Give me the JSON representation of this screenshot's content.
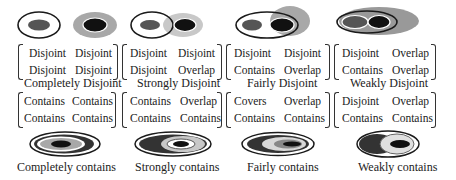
{
  "colors": {
    "outline": "#1a1a1a",
    "dark": "#111111",
    "mid_gray": "#555555",
    "light_gray": "#a8a8a8",
    "pale_gray": "#d0d0d0"
  },
  "top_row": [
    {
      "caption": "Completely Disjoint",
      "matrix": [
        [
          "Disjoint",
          "Disjoint"
        ],
        [
          "Disjoint",
          "Disjoint"
        ]
      ]
    },
    {
      "caption": "Strongly Disjoint",
      "matrix": [
        [
          "Disjoint",
          "Disjoint"
        ],
        [
          "Disjoint",
          "Overlap"
        ]
      ]
    },
    {
      "caption": "Fairly Disjoint",
      "matrix": [
        [
          "Disjoint",
          "Disjoint"
        ],
        [
          "Contains",
          "Overlap"
        ]
      ]
    },
    {
      "caption": "Weakly Disjoint",
      "matrix": [
        [
          "Disjoint",
          "Overlap"
        ],
        [
          "Contains",
          "Overlap"
        ]
      ]
    }
  ],
  "bottom_row": [
    {
      "caption": "Completely contains",
      "matrix": [
        [
          "Contains",
          "Contains"
        ],
        [
          "Contains",
          "Contains"
        ]
      ]
    },
    {
      "caption": "Strongly contains",
      "matrix": [
        [
          "Contains",
          "Overlap"
        ],
        [
          "Contains",
          "Contains"
        ]
      ]
    },
    {
      "caption": "Fairly contains",
      "matrix": [
        [
          "Covers",
          "Overlap"
        ],
        [
          "Contains",
          "Contains"
        ]
      ]
    },
    {
      "caption": "Weakly contains",
      "matrix": [
        [
          "Disjoint",
          "Overlap"
        ],
        [
          "Contains",
          "Contains"
        ]
      ]
    }
  ]
}
